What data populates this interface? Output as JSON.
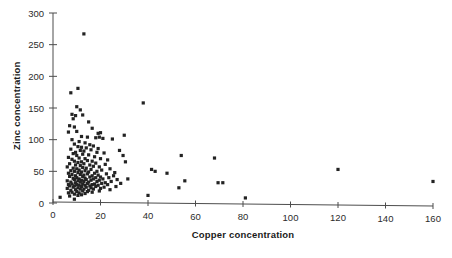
{
  "chart_data": {
    "type": "scatter",
    "title": "",
    "xlabel": "Copper concentration",
    "ylabel": "Zinc concentration",
    "xlim": [
      0,
      160
    ],
    "ylim": [
      0,
      300
    ],
    "xticks": [
      0,
      20,
      40,
      60,
      80,
      100,
      120,
      140,
      160
    ],
    "yticks": [
      0,
      50,
      100,
      150,
      200,
      250,
      300
    ],
    "grid": false,
    "legend": null,
    "marker": {
      "shape": "square",
      "color": "#232323",
      "size_px": 3.2
    },
    "series": [
      {
        "name": "samples",
        "points": [
          [
            13.0,
            267
          ],
          [
            7.5,
            174
          ],
          [
            10.5,
            181
          ],
          [
            38.0,
            158
          ],
          [
            10.0,
            152
          ],
          [
            11.5,
            147
          ],
          [
            9.5,
            138
          ],
          [
            12.5,
            139
          ],
          [
            8.0,
            140
          ],
          [
            8.5,
            133
          ],
          [
            15.0,
            128
          ],
          [
            7.0,
            122
          ],
          [
            9.0,
            120
          ],
          [
            16.5,
            118
          ],
          [
            10.0,
            113
          ],
          [
            6.5,
            112
          ],
          [
            19.0,
            110
          ],
          [
            20.0,
            111
          ],
          [
            30.0,
            107
          ],
          [
            12.0,
            105
          ],
          [
            14.5,
            104
          ],
          [
            18.0,
            103
          ],
          [
            19.5,
            104
          ],
          [
            21.0,
            102
          ],
          [
            8.0,
            100
          ],
          [
            25.0,
            101
          ],
          [
            11.0,
            97
          ],
          [
            13.5,
            95
          ],
          [
            9.0,
            93
          ],
          [
            15.5,
            92
          ],
          [
            17.0,
            90
          ],
          [
            10.5,
            89
          ],
          [
            12.0,
            88
          ],
          [
            14.0,
            87
          ],
          [
            19.0,
            86
          ],
          [
            7.5,
            85
          ],
          [
            16.0,
            84
          ],
          [
            11.5,
            83
          ],
          [
            13.0,
            82
          ],
          [
            28.0,
            83
          ],
          [
            9.5,
            80
          ],
          [
            18.5,
            80
          ],
          [
            21.5,
            79
          ],
          [
            8.5,
            78
          ],
          [
            12.5,
            77
          ],
          [
            15.0,
            76
          ],
          [
            10.0,
            75
          ],
          [
            29.5,
            75
          ],
          [
            54.0,
            75
          ],
          [
            68.0,
            71
          ],
          [
            17.5,
            73
          ],
          [
            6.5,
            72
          ],
          [
            11.0,
            71
          ],
          [
            13.5,
            70
          ],
          [
            20.0,
            70
          ],
          [
            8.0,
            69
          ],
          [
            23.0,
            68
          ],
          [
            14.5,
            67
          ],
          [
            9.0,
            66
          ],
          [
            16.5,
            66
          ],
          [
            12.0,
            65
          ],
          [
            30.5,
            65
          ],
          [
            10.5,
            64
          ],
          [
            18.0,
            63
          ],
          [
            7.0,
            62
          ],
          [
            13.0,
            62
          ],
          [
            22.0,
            61
          ],
          [
            15.5,
            60
          ],
          [
            9.5,
            60
          ],
          [
            11.5,
            59
          ],
          [
            120.0,
            53
          ],
          [
            41.5,
            53
          ],
          [
            43.0,
            50
          ],
          [
            17.0,
            58
          ],
          [
            19.5,
            57
          ],
          [
            6.0,
            57
          ],
          [
            12.5,
            56
          ],
          [
            14.0,
            55
          ],
          [
            8.5,
            55
          ],
          [
            24.0,
            54
          ],
          [
            10.0,
            54
          ],
          [
            16.0,
            53
          ],
          [
            11.0,
            52
          ],
          [
            20.5,
            52
          ],
          [
            7.5,
            51
          ],
          [
            13.5,
            51
          ],
          [
            18.5,
            50
          ],
          [
            9.0,
            50
          ],
          [
            15.0,
            49
          ],
          [
            12.0,
            49
          ],
          [
            26.0,
            48
          ],
          [
            48.0,
            47
          ],
          [
            10.5,
            48
          ],
          [
            17.5,
            47
          ],
          [
            6.5,
            47
          ],
          [
            14.5,
            46
          ],
          [
            22.5,
            46
          ],
          [
            8.0,
            45
          ],
          [
            11.5,
            45
          ],
          [
            19.0,
            44
          ],
          [
            13.0,
            44
          ],
          [
            16.5,
            43
          ],
          [
            9.5,
            43
          ],
          [
            25.5,
            43
          ],
          [
            7.0,
            42
          ],
          [
            12.5,
            42
          ],
          [
            20.0,
            41
          ],
          [
            15.5,
            41
          ],
          [
            10.0,
            40
          ],
          [
            18.0,
            40
          ],
          [
            23.5,
            40
          ],
          [
            13.5,
            39
          ],
          [
            8.5,
            39
          ],
          [
            11.0,
            38
          ],
          [
            17.0,
            38
          ],
          [
            21.0,
            38
          ],
          [
            31.5,
            38
          ],
          [
            14.0,
            37
          ],
          [
            9.0,
            37
          ],
          [
            27.0,
            37
          ],
          [
            12.0,
            36
          ],
          [
            16.0,
            36
          ],
          [
            19.5,
            36
          ],
          [
            55.5,
            35
          ],
          [
            160.0,
            34
          ],
          [
            69.5,
            32
          ],
          [
            71.5,
            32
          ],
          [
            6.0,
            35
          ],
          [
            10.5,
            35
          ],
          [
            13.0,
            34
          ],
          [
            18.5,
            34
          ],
          [
            24.5,
            34
          ],
          [
            7.5,
            33
          ],
          [
            11.5,
            33
          ],
          [
            15.0,
            33
          ],
          [
            22.0,
            32
          ],
          [
            9.5,
            32
          ],
          [
            14.5,
            31
          ],
          [
            20.5,
            31
          ],
          [
            28.5,
            31
          ],
          [
            8.0,
            30
          ],
          [
            12.5,
            30
          ],
          [
            17.5,
            30
          ],
          [
            6.5,
            29
          ],
          [
            10.0,
            29
          ],
          [
            16.5,
            29
          ],
          [
            23.0,
            29
          ],
          [
            11.0,
            28
          ],
          [
            13.5,
            28
          ],
          [
            19.0,
            28
          ],
          [
            53.0,
            24
          ],
          [
            7.0,
            27
          ],
          [
            9.0,
            27
          ],
          [
            15.5,
            27
          ],
          [
            26.5,
            26
          ],
          [
            12.0,
            26
          ],
          [
            18.0,
            26
          ],
          [
            21.5,
            25
          ],
          [
            8.5,
            25
          ],
          [
            14.0,
            25
          ],
          [
            10.5,
            24
          ],
          [
            16.0,
            24
          ],
          [
            20.0,
            23
          ],
          [
            6.0,
            23
          ],
          [
            11.5,
            22
          ],
          [
            13.0,
            22
          ],
          [
            17.0,
            22
          ],
          [
            24.0,
            21
          ],
          [
            9.5,
            21
          ],
          [
            15.0,
            20
          ],
          [
            7.5,
            20
          ],
          [
            12.5,
            19
          ],
          [
            19.5,
            19
          ],
          [
            10.0,
            18
          ],
          [
            14.5,
            18
          ],
          [
            8.0,
            17
          ],
          [
            16.5,
            17
          ],
          [
            11.0,
            16
          ],
          [
            6.5,
            16
          ],
          [
            13.5,
            15
          ],
          [
            9.0,
            14
          ],
          [
            12.0,
            13
          ],
          [
            10.5,
            12
          ],
          [
            7.0,
            11
          ],
          [
            3.0,
            9
          ],
          [
            40.0,
            12
          ],
          [
            9.0,
            6
          ],
          [
            81.0,
            8
          ]
        ]
      }
    ]
  },
  "axes": {
    "x_title": "Copper concentration",
    "y_title": "Zinc concentration",
    "x_tick_labels": [
      "0",
      "20",
      "40",
      "60",
      "80",
      "100",
      "120",
      "140",
      "160"
    ],
    "y_tick_labels": [
      "0",
      "50",
      "100",
      "150",
      "200",
      "250",
      "300"
    ]
  },
  "colors": {
    "marker": "#232323",
    "axis": "#4d4d4d",
    "background": "#ffffff",
    "text": "#1a1a1a"
  }
}
